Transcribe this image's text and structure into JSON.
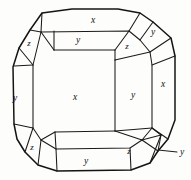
{
  "figure": {
    "stroke_color": "#1a1a1a",
    "outline_color": "#141414",
    "background_color": "#fdfdfc"
  },
  "labels": [
    {
      "id": "top-x",
      "text": "x",
      "x": 93,
      "y": 21,
      "size": "normal"
    },
    {
      "id": "top-y-band",
      "text": "y",
      "x": 78,
      "y": 41,
      "size": "normal"
    },
    {
      "id": "top-left-z",
      "text": "z",
      "x": 29,
      "y": 44,
      "size": "small"
    },
    {
      "id": "top-right-z",
      "text": "z",
      "x": 127,
      "y": 47,
      "size": "small"
    },
    {
      "id": "top-right-y",
      "text": "y",
      "x": 153,
      "y": 33,
      "size": "normal"
    },
    {
      "id": "right-x",
      "text": "x",
      "x": 163,
      "y": 85,
      "size": "normal"
    },
    {
      "id": "center-x",
      "text": "x",
      "x": 75,
      "y": 98,
      "size": "normal"
    },
    {
      "id": "left-y",
      "text": "y",
      "x": 15,
      "y": 99,
      "size": "normal"
    },
    {
      "id": "right-y",
      "text": "y",
      "x": 133,
      "y": 96,
      "size": "normal"
    },
    {
      "id": "bottom-left-z",
      "text": "z",
      "x": 32,
      "y": 148,
      "size": "small"
    },
    {
      "id": "bottom-y-band",
      "text": "y",
      "x": 86,
      "y": 162,
      "size": "normal"
    },
    {
      "id": "bottom-right-z",
      "text": "z",
      "x": 129,
      "y": 152,
      "size": "small"
    },
    {
      "id": "leader-y",
      "text": "y",
      "x": 182,
      "y": 153,
      "size": "normal"
    }
  ],
  "geometry": {
    "outer_outline": "M 42,13 L 72,9 L 118,9 L 140,13 L 153,22 L 171,38 L 175,55 L 175,120 L 168,139 L 157,152 L 150,162 L 131,170 L 57,171 L 38,165 L 25,152 L 17,139 L 14,124 L 13,67 L 19,48 L 30,30 Z",
    "inner_octagon": "M 41,32 L 54,31 L 129,31 L 140,40 L 150,52 L 152,65 L 152,128 L 142,140 L 130,148 L 56,149 L 41,140 L 33,128 L 33,65 Z",
    "edges": [
      "M 42,13 L 41,32",
      "M 30,30 L 41,32",
      "M 19,48 L 33,65",
      "M 33,65 L 14,66",
      "M 33,128 L 14,124",
      "M 33,128 L 25,152",
      "M 41,140 L 38,165",
      "M 56,149 L 57,171",
      "M 130,148 L 131,170",
      "M 142,140 L 157,152",
      "M 152,128 L 168,139",
      "M 152,65 L 175,55",
      "M 150,52 L 171,38",
      "M 140,40 L 153,22",
      "M 129,31 L 140,13",
      "M 54,31 L 54,50",
      "M 54,50 L 129,50",
      "M 129,50 L 129,31",
      "M 54,50 L 41,32",
      "M 129,50 L 140,40",
      "M 115,60 L 115,131",
      "M 115,60 L 150,52",
      "M 115,60 L 129,50",
      "M 115,131 L 142,140",
      "M 115,131 L 152,128",
      "M 56,149 L 55,132",
      "M 55,132 L 115,131",
      "M 41,140 L 55,132",
      "M 152,128 L 160,134",
      "M 160,134 L 150,162",
      "M 157,152 L 160,134"
    ],
    "leader": "M 155,152 L 177,152"
  }
}
